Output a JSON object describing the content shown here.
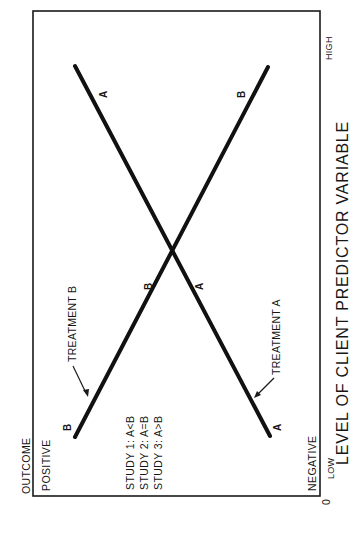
{
  "diagram": {
    "orientation": "rotated 90 degrees counter-clockwise",
    "y_axis": {
      "title": "OUTCOME",
      "top_label": "POSITIVE",
      "bottom_label": "NEGATIVE",
      "origin": "0"
    },
    "x_axis": {
      "title": "LEVEL OF CLIENT PREDICTOR VARIABLE",
      "low_label": "LOW",
      "high_label": "HIGH"
    },
    "lines": [
      {
        "name": "Treatment A",
        "label": "TREATMENT A",
        "point_label": "A",
        "from": "low predictor / negative outcome",
        "to": "high predictor / positive outcome"
      },
      {
        "name": "Treatment B",
        "label": "TREATMENT B",
        "point_label": "B",
        "from": "low predictor / positive outcome",
        "to": "high predictor / negative outcome"
      }
    ],
    "point_labels": {
      "b_start": "B",
      "a_start": "A",
      "b_mid": "B",
      "a_mid": "A",
      "a_end": "A",
      "b_end": "B"
    },
    "studies": [
      {
        "label": "STUDY 1: A<B"
      },
      {
        "label": "STUDY 2: A=B"
      },
      {
        "label": "STUDY 3: A>B"
      }
    ],
    "colors": {
      "ink": "#111111",
      "background": "#ffffff"
    }
  }
}
